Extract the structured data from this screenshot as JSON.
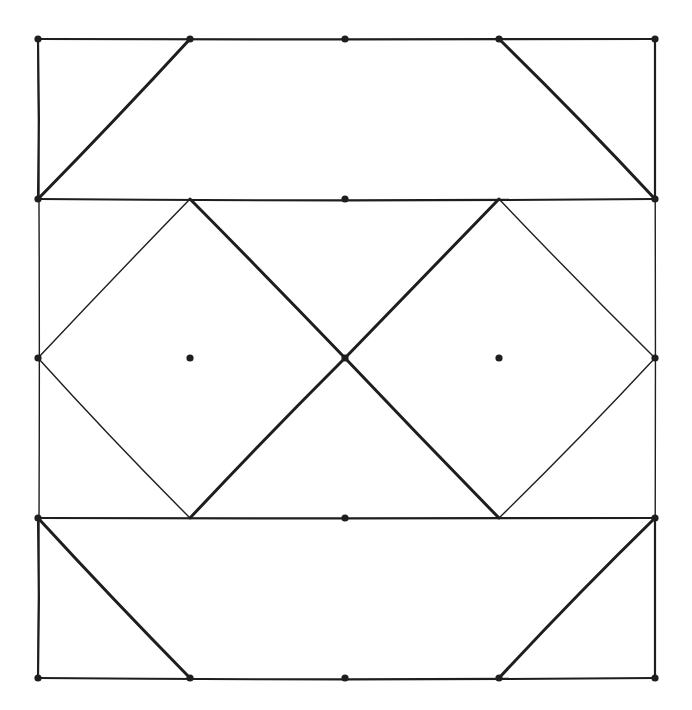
{
  "diagram": {
    "stroke_color": "#1e1e1e",
    "background_color": "#ffffff",
    "grid": {
      "columns": 5,
      "rows": 5
    },
    "dots": [
      [
        0,
        0
      ],
      [
        1,
        0
      ],
      [
        2,
        0
      ],
      [
        3,
        0
      ],
      [
        4,
        0
      ],
      [
        0,
        1
      ],
      [
        2,
        1
      ],
      [
        4,
        1
      ],
      [
        0,
        2
      ],
      [
        1,
        2
      ],
      [
        2,
        2
      ],
      [
        3,
        2
      ],
      [
        4,
        2
      ],
      [
        0,
        3
      ],
      [
        2,
        3
      ],
      [
        4,
        3
      ],
      [
        0,
        4
      ],
      [
        1,
        4
      ],
      [
        2,
        4
      ],
      [
        3,
        4
      ],
      [
        4,
        4
      ]
    ],
    "segments": [
      {
        "name": "outer-left-edge",
        "from": [
          0,
          0
        ],
        "to": [
          0,
          4
        ],
        "weight": "thin"
      },
      {
        "name": "outer-right-edge",
        "from": [
          4,
          0
        ],
        "to": [
          4,
          4
        ],
        "weight": "thin"
      },
      {
        "name": "top-band-top",
        "from": [
          0,
          0
        ],
        "to": [
          4,
          0
        ],
        "weight": "med"
      },
      {
        "name": "top-band-bottom",
        "from": [
          0,
          1
        ],
        "to": [
          4,
          1
        ],
        "weight": "med"
      },
      {
        "name": "top-band-left",
        "from": [
          0,
          0
        ],
        "to": [
          0,
          1
        ],
        "weight": "med"
      },
      {
        "name": "top-band-right",
        "from": [
          4,
          0
        ],
        "to": [
          4,
          1
        ],
        "weight": "med"
      },
      {
        "name": "top-left-diagonal",
        "from": [
          0,
          1
        ],
        "to": [
          1,
          0
        ],
        "weight": "thick"
      },
      {
        "name": "top-right-diagonal",
        "from": [
          3,
          0
        ],
        "to": [
          4,
          1
        ],
        "weight": "thick"
      },
      {
        "name": "left-diamond-ne",
        "from": [
          1,
          1
        ],
        "to": [
          2,
          2
        ],
        "weight": "thick"
      },
      {
        "name": "left-diamond-nw",
        "from": [
          1,
          1
        ],
        "to": [
          0,
          2
        ],
        "weight": "thin"
      },
      {
        "name": "left-diamond-sw",
        "from": [
          0,
          2
        ],
        "to": [
          1,
          3
        ],
        "weight": "thin"
      },
      {
        "name": "left-diamond-se",
        "from": [
          1,
          3
        ],
        "to": [
          2,
          2
        ],
        "weight": "thick"
      },
      {
        "name": "right-diamond-nw",
        "from": [
          3,
          1
        ],
        "to": [
          2,
          2
        ],
        "weight": "thick"
      },
      {
        "name": "right-diamond-ne",
        "from": [
          3,
          1
        ],
        "to": [
          4,
          2
        ],
        "weight": "thin"
      },
      {
        "name": "right-diamond-se",
        "from": [
          4,
          2
        ],
        "to": [
          3,
          3
        ],
        "weight": "thin"
      },
      {
        "name": "right-diamond-sw",
        "from": [
          3,
          3
        ],
        "to": [
          2,
          2
        ],
        "weight": "thick"
      },
      {
        "name": "bottom-band-top",
        "from": [
          0,
          3
        ],
        "to": [
          4,
          3
        ],
        "weight": "med"
      },
      {
        "name": "bottom-band-bottom",
        "from": [
          0,
          4
        ],
        "to": [
          4,
          4
        ],
        "weight": "med"
      },
      {
        "name": "bottom-band-left",
        "from": [
          0,
          3
        ],
        "to": [
          0,
          4
        ],
        "weight": "med"
      },
      {
        "name": "bottom-band-right",
        "from": [
          4,
          3
        ],
        "to": [
          4,
          4
        ],
        "weight": "med"
      },
      {
        "name": "bottom-left-diagonal",
        "from": [
          0,
          3
        ],
        "to": [
          1,
          4
        ],
        "weight": "thick"
      },
      {
        "name": "bottom-right-diagonal",
        "from": [
          3,
          4
        ],
        "to": [
          4,
          3
        ],
        "weight": "thick"
      }
    ]
  }
}
